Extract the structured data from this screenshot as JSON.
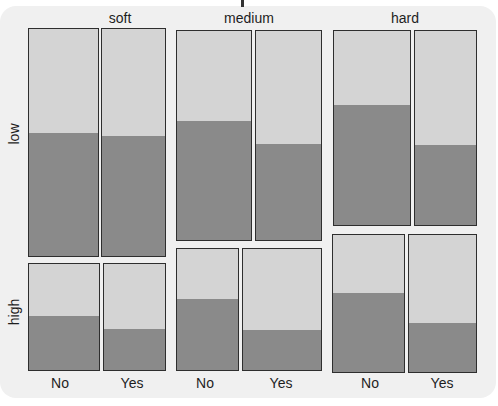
{
  "chart_data": {
    "type": "mosaic",
    "title": "",
    "column_variable_levels": [
      "soft",
      "medium",
      "hard"
    ],
    "row_variable_levels": [
      "low",
      "high"
    ],
    "x_levels": [
      "No",
      "Yes"
    ],
    "fill_levels": [
      "dark (lower segment)",
      "light (upper segment)"
    ],
    "colors": {
      "dark": "#8a8a8a",
      "light": "#d4d4d4",
      "border": "#2e2e2e",
      "panel": "#f0f0f0"
    },
    "cells": [
      {
        "column": "soft",
        "row": "low",
        "x": "No",
        "dark_fraction": 0.54,
        "box": [
          28,
          28,
          71,
          229
        ]
      },
      {
        "column": "soft",
        "row": "low",
        "x": "Yes",
        "dark_fraction": 0.53,
        "box": [
          101,
          28,
          65,
          229
        ]
      },
      {
        "column": "soft",
        "row": "high",
        "x": "No",
        "dark_fraction": 0.51,
        "box": [
          28,
          263,
          72,
          108
        ]
      },
      {
        "column": "soft",
        "row": "high",
        "x": "Yes",
        "dark_fraction": 0.39,
        "box": [
          103,
          263,
          63,
          108
        ]
      },
      {
        "column": "medium",
        "row": "low",
        "x": "No",
        "dark_fraction": 0.57,
        "box": [
          176,
          30,
          76,
          211
        ]
      },
      {
        "column": "medium",
        "row": "low",
        "x": "Yes",
        "dark_fraction": 0.46,
        "box": [
          255,
          30,
          67,
          211
        ]
      },
      {
        "column": "medium",
        "row": "high",
        "x": "No",
        "dark_fraction": 0.59,
        "box": [
          176,
          248,
          63,
          123
        ]
      },
      {
        "column": "medium",
        "row": "high",
        "x": "Yes",
        "dark_fraction": 0.33,
        "box": [
          242,
          248,
          80,
          123
        ]
      },
      {
        "column": "hard",
        "row": "low",
        "x": "No",
        "dark_fraction": 0.62,
        "box": [
          333,
          30,
          78,
          196
        ]
      },
      {
        "column": "hard",
        "row": "low",
        "x": "Yes",
        "dark_fraction": 0.41,
        "box": [
          414,
          30,
          63,
          196
        ]
      },
      {
        "column": "hard",
        "row": "high",
        "x": "No",
        "dark_fraction": 0.58,
        "box": [
          332,
          234,
          73,
          139
        ]
      },
      {
        "column": "hard",
        "row": "high",
        "x": "Yes",
        "dark_fraction": 0.36,
        "box": [
          408,
          234,
          69,
          139
        ]
      }
    ],
    "xlabel": "",
    "ylabel": "",
    "grid": false,
    "legend": "none"
  },
  "labels": {
    "columns": [
      {
        "text": "soft",
        "cx": 120
      },
      {
        "text": "medium",
        "cx": 249
      },
      {
        "text": "hard",
        "cx": 405
      }
    ],
    "rows": [
      {
        "text": "low",
        "cx": 14,
        "cy": 134
      },
      {
        "text": "high",
        "cx": 14,
        "cy": 312
      }
    ],
    "x": [
      {
        "text": "No",
        "cx": 60
      },
      {
        "text": "Yes",
        "cx": 132
      },
      {
        "text": "No",
        "cx": 205
      },
      {
        "text": "Yes",
        "cx": 281
      },
      {
        "text": "No",
        "cx": 370
      },
      {
        "text": "Yes",
        "cx": 442
      }
    ]
  }
}
